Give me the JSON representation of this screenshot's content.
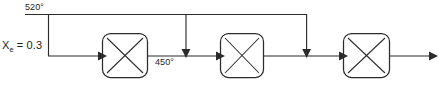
{
  "diagram": {
    "type": "process-flow-diagram",
    "colors": {
      "line": "#2b2b2b",
      "text": "#1d1d1d",
      "background": "#ffffff"
    },
    "labels": {
      "inlet_temperature": "520°",
      "interstage_temperature": "450°",
      "conversion_symbol": "X",
      "conversion_subscript": "e",
      "conversion_equals": " = 0.3",
      "conversion_full": "Xₑ = 0.3"
    },
    "units": [
      {
        "id": "reactor-1",
        "label": "",
        "x": 102,
        "y": 33,
        "width": 46,
        "height": 45
      },
      {
        "id": "reactor-2",
        "label": "",
        "x": 220,
        "y": 33,
        "width": 44,
        "height": 45
      },
      {
        "id": "reactor-3",
        "label": "",
        "x": 343,
        "y": 33,
        "width": 47,
        "height": 45
      }
    ],
    "streams": [
      {
        "id": "header-520",
        "label": "520°",
        "kind": "header"
      },
      {
        "id": "feed-inlet",
        "label": "Xₑ = 0.3",
        "kind": "feed"
      },
      {
        "id": "quench-1",
        "label": "",
        "kind": "quench"
      },
      {
        "id": "quench-2",
        "label": "",
        "kind": "quench"
      },
      {
        "id": "quench-3",
        "label": "",
        "kind": "quench"
      },
      {
        "id": "interstage-450",
        "label": "450°",
        "kind": "process"
      },
      {
        "id": "product-outlet",
        "label": "",
        "kind": "product"
      }
    ]
  }
}
